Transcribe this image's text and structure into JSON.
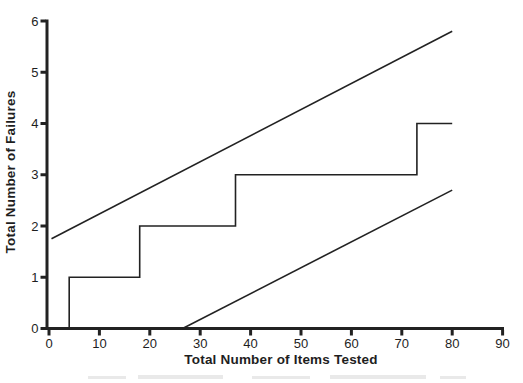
{
  "figure": {
    "background_color": "#ffffff",
    "ink_color": "#222222",
    "title": ""
  },
  "chart_data": {
    "type": "line",
    "title": "",
    "xlabel": "Total Number of Items Tested",
    "ylabel": "Total Number of Failures",
    "xlim": [
      0,
      90
    ],
    "ylim": [
      0,
      6
    ],
    "xticks": [
      0,
      10,
      20,
      30,
      40,
      50,
      60,
      70,
      80,
      90
    ],
    "yticks": [
      0,
      1,
      2,
      3,
      4,
      5,
      6
    ],
    "grid": false,
    "legend_position": "none",
    "series": [
      {
        "name": "upper-decision-boundary",
        "style": "straight",
        "points": [
          [
            0.5,
            1.75
          ],
          [
            80,
            5.8
          ]
        ]
      },
      {
        "name": "observed-failures-step",
        "style": "step",
        "points": [
          [
            4,
            0
          ],
          [
            4,
            1
          ],
          [
            18,
            1
          ],
          [
            18,
            2
          ],
          [
            37,
            2
          ],
          [
            37,
            3
          ],
          [
            73,
            3
          ],
          [
            73,
            4
          ],
          [
            80,
            4
          ]
        ]
      },
      {
        "name": "lower-decision-boundary",
        "style": "straight",
        "points": [
          [
            26.5,
            0
          ],
          [
            80,
            2.7
          ]
        ]
      }
    ],
    "failure_events_at_items": [
      4,
      18,
      37,
      73
    ]
  }
}
